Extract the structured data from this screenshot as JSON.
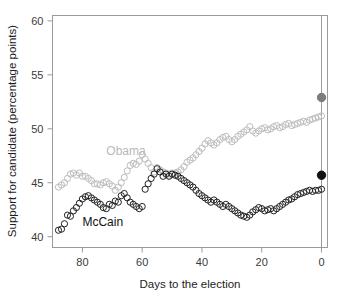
{
  "chart_data": {
    "type": "scatter",
    "title": "",
    "xlabel": "Days to the election",
    "ylabel": "Support for candidate (percentage points)",
    "xlim": [
      90,
      -2
    ],
    "ylim": [
      39,
      60.5
    ],
    "xticks": [
      80,
      60,
      40,
      20,
      0
    ],
    "yticks": [
      40,
      45,
      50,
      55,
      60
    ],
    "xtick_labels": [
      "80",
      "60",
      "40",
      "20",
      "0"
    ],
    "ytick_labels": [
      "40",
      "45",
      "50",
      "55",
      "60"
    ],
    "grid": false,
    "legend_position": "inline-annotation",
    "annotations": [
      {
        "text": "Obama",
        "x": 72,
        "y": 47.6,
        "color": "#b9b9b9"
      },
      {
        "text": "McCain",
        "x": 80,
        "y": 41.0,
        "color": "#111111"
      }
    ],
    "reference_line": {
      "x": 0,
      "color": "#9a9a9a",
      "orientation": "vertical"
    },
    "series": [
      {
        "name": "Obama",
        "color": "#bdbdbd",
        "marker": "open-circle",
        "x": [
          88,
          87,
          86,
          85,
          84,
          83,
          82,
          81,
          80,
          79,
          78,
          77,
          76,
          75,
          74,
          73,
          72,
          71,
          70,
          69,
          68,
          67,
          66,
          65,
          64,
          63,
          62,
          61,
          60,
          59,
          58,
          57,
          56,
          55,
          54,
          53,
          52,
          51,
          50,
          49,
          48,
          47,
          46,
          45,
          44,
          43,
          42,
          41,
          40,
          39,
          38,
          37,
          36,
          35,
          34,
          33,
          32,
          31,
          30,
          29,
          28,
          27,
          26,
          25,
          24,
          23,
          22,
          21,
          20,
          19,
          18,
          17,
          16,
          15,
          14,
          13,
          12,
          11,
          10,
          9,
          8,
          7,
          6,
          5,
          4,
          3,
          2,
          1,
          0
        ],
        "y": [
          44.6,
          44.8,
          45.0,
          45.4,
          45.8,
          45.9,
          45.7,
          45.9,
          45.6,
          45.6,
          45.4,
          45.2,
          44.9,
          44.9,
          44.8,
          45.0,
          45.1,
          44.9,
          44.7,
          44.3,
          44.6,
          45.0,
          45.5,
          46.1,
          46.6,
          46.8,
          46.7,
          47.0,
          47.6,
          47.2,
          46.8,
          46.4,
          46.0,
          46.4,
          46.2,
          46.0,
          45.9,
          45.7,
          45.9,
          45.9,
          46.0,
          46.2,
          46.5,
          46.9,
          47.1,
          47.3,
          47.6,
          47.9,
          48.2,
          48.6,
          48.9,
          48.7,
          48.5,
          48.7,
          49.0,
          49.2,
          49.3,
          49.0,
          48.8,
          49.0,
          49.3,
          49.5,
          49.7,
          49.9,
          50.2,
          49.8,
          49.6,
          49.8,
          50.0,
          50.1,
          49.9,
          50.0,
          50.2,
          50.3,
          50.1,
          50.2,
          50.4,
          50.5,
          50.3,
          50.4,
          50.5,
          50.6,
          50.7,
          50.6,
          50.8,
          50.9,
          51.0,
          51.1,
          51.2
        ]
      },
      {
        "name": "McCain",
        "color": "#222222",
        "marker": "open-circle",
        "x": [
          88,
          87,
          86,
          85,
          84,
          83,
          82,
          81,
          80,
          79,
          78,
          77,
          76,
          75,
          74,
          73,
          72,
          71,
          70,
          69,
          68,
          67,
          66,
          65,
          64,
          63,
          62,
          61,
          60,
          59,
          58,
          57,
          56,
          55,
          54,
          53,
          52,
          51,
          50,
          49,
          48,
          47,
          46,
          45,
          44,
          43,
          42,
          41,
          40,
          39,
          38,
          37,
          36,
          35,
          34,
          33,
          32,
          31,
          30,
          29,
          28,
          27,
          26,
          25,
          24,
          23,
          22,
          21,
          20,
          19,
          18,
          17,
          16,
          15,
          14,
          13,
          12,
          11,
          10,
          9,
          8,
          7,
          6,
          5,
          4,
          3,
          2,
          1,
          0
        ],
        "y": [
          40.6,
          40.7,
          41.2,
          42.0,
          41.9,
          42.4,
          42.7,
          43.1,
          43.5,
          43.7,
          43.8,
          43.6,
          43.4,
          43.2,
          43.0,
          42.7,
          42.6,
          43.0,
          42.9,
          43.3,
          43.2,
          43.8,
          44.0,
          43.6,
          43.2,
          43.0,
          42.8,
          42.6,
          42.8,
          44.4,
          44.9,
          45.4,
          45.8,
          46.3,
          46.0,
          45.6,
          45.8,
          45.6,
          45.8,
          45.7,
          45.6,
          45.4,
          45.2,
          45.0,
          44.8,
          44.6,
          44.3,
          44.0,
          43.8,
          43.6,
          43.4,
          43.2,
          43.4,
          43.2,
          43.0,
          42.8,
          43.0,
          42.8,
          42.6,
          42.4,
          42.2,
          42.0,
          41.9,
          41.8,
          42.0,
          42.3,
          42.5,
          42.7,
          42.6,
          42.4,
          42.5,
          42.6,
          42.4,
          42.6,
          42.8,
          43.0,
          43.2,
          43.4,
          43.5,
          43.7,
          43.9,
          44.0,
          44.1,
          44.2,
          44.3,
          44.2,
          44.3,
          44.3,
          44.4
        ]
      }
    ],
    "final_points": [
      {
        "name": "Obama final result",
        "x": 0,
        "y": 52.9,
        "color": "#7d7d7d",
        "marker": "filled-circle"
      },
      {
        "name": "McCain final result",
        "x": 0,
        "y": 45.7,
        "color": "#111111",
        "marker": "filled-circle"
      }
    ]
  }
}
